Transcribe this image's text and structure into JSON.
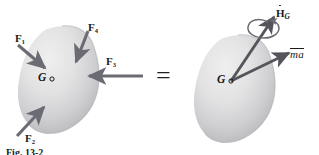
{
  "figure": {
    "caption": "Fig. 13-2",
    "equals_sign": "="
  },
  "left_body": {
    "name": "free-body-diagram",
    "center_label": "G",
    "center_marker": "○",
    "forces": [
      {
        "id": "F1",
        "symbol": "F",
        "subscript": "1",
        "label": "F₁",
        "direction_deg": 35,
        "description": "force F1 pointing down-right into body from upper left"
      },
      {
        "id": "F4",
        "symbol": "F",
        "subscript": "4",
        "label": "F₄",
        "direction_deg": 105,
        "description": "force F4 pointing down-left into body from top"
      },
      {
        "id": "F3",
        "symbol": "F",
        "subscript": "3",
        "label": "F₃",
        "direction_deg": 180,
        "description": "force F3 pointing left into body from right"
      },
      {
        "id": "F2",
        "symbol": "F",
        "subscript": "2",
        "label": "F₂",
        "direction_deg": -55,
        "description": "force F2 pointing up-right into body from lower left"
      }
    ]
  },
  "right_body": {
    "name": "kinetic-diagram",
    "center_label": "G",
    "center_marker": "○",
    "vectors": [
      {
        "id": "HG",
        "symbol": "H",
        "subscript": "G",
        "label": "Ḣ_G",
        "accent": "dot",
        "description": "rate of change of angular momentum about G, with curved spin arrow around shaft"
      },
      {
        "id": "ma",
        "symbol": "ma",
        "label": "mā",
        "accent": "overbar",
        "description": "mass times acceleration of mass center"
      }
    ],
    "spin_arrow": "curved-rotation-arrow"
  },
  "colors": {
    "arrow": "#6b6b73",
    "body_fill_light": "#e9e9ea",
    "body_fill_mid": "#d3d3d6",
    "body_fill_dark": "#b9b9bd",
    "text": "#1a1a1a",
    "background": "#ffffff"
  }
}
